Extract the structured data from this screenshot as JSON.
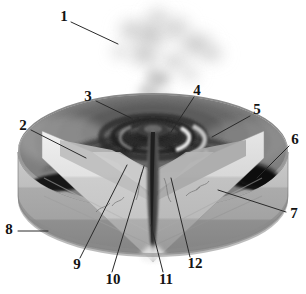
{
  "figure": {
    "style": "grayscale shaded illustration",
    "background_color": "#ffffff",
    "ink_color": "#131313",
    "leader_color": "#2a2a2a"
  },
  "callouts": [
    {
      "id": "1",
      "label": "1",
      "text_x": 64,
      "text_y": 18,
      "line": "71,22 L 118,44"
    },
    {
      "id": "2",
      "label": "2",
      "text_x": 23,
      "text_y": 127,
      "line": "31,130 L 86,158"
    },
    {
      "id": "3",
      "label": "3",
      "text_x": 88,
      "text_y": 98,
      "line": "96,101 L 131,118"
    },
    {
      "id": "4",
      "label": "4",
      "text_x": 197,
      "text_y": 92,
      "line": "194,97 L 171,132"
    },
    {
      "id": "5",
      "label": "5",
      "text_x": 257,
      "text_y": 111,
      "line": "250,116 L 212,137"
    },
    {
      "id": "6",
      "label": "6",
      "text_x": 295,
      "text_y": 141,
      "line": "289,146 L 257,178"
    },
    {
      "id": "7",
      "label": "7",
      "text_x": 294,
      "text_y": 215,
      "line": "286,212 L 218,190"
    },
    {
      "id": "8",
      "label": "8",
      "text_x": 9,
      "text_y": 231,
      "line": "18,231 L 48,231"
    },
    {
      "id": "9",
      "label": "9",
      "text_x": 77,
      "text_y": 266,
      "line": "80,258 L 127,165"
    },
    {
      "id": "10",
      "label": "10",
      "text_x": 113,
      "text_y": 281,
      "line": "112,272 L 144,166"
    },
    {
      "id": "11",
      "label": "11",
      "text_x": 166,
      "text_y": 281,
      "line": "163,272 L 151,225"
    },
    {
      "id": "12",
      "label": "12",
      "text_x": 195,
      "text_y": 265,
      "line": "190,257 L 171,178"
    }
  ],
  "scene": {
    "plume": {
      "name": "ash-and-smoke-plume",
      "color": "#b9b9b9",
      "center_x": 153,
      "top_y": 6
    },
    "cone": {
      "name": "volcanic-cone",
      "summit_x": 152,
      "summit_y": 118,
      "rim_color": "#9a9a9a",
      "flank_color": "#7c7c7c"
    },
    "crater_rings": {
      "name": "concentric-crater-rings",
      "count": 4,
      "dark_color": "#2f2f2f",
      "light_color": "#d9d9d9"
    },
    "lava_flows": {
      "name": "radiating-lava-flow-streaks",
      "color": "#1d1d1d",
      "count": 6
    },
    "conduit": {
      "name": "central-conduit",
      "color": "#3a3a3a",
      "top_y": 130,
      "bottom_y": 262
    },
    "strata": [
      {
        "name": "upper-stratum",
        "color": "#e8e8e8"
      },
      {
        "name": "middle-stratum",
        "color": "#cfcfcf"
      },
      {
        "name": "lower-stratum",
        "color": "#b0b0b0"
      },
      {
        "name": "base-stratum",
        "color": "#9b9b9b"
      }
    ],
    "cut_faces": {
      "name": "wedge-cut-faces",
      "left_face_color": "#dcdcdc",
      "right_face_color": "#cacaca"
    }
  }
}
